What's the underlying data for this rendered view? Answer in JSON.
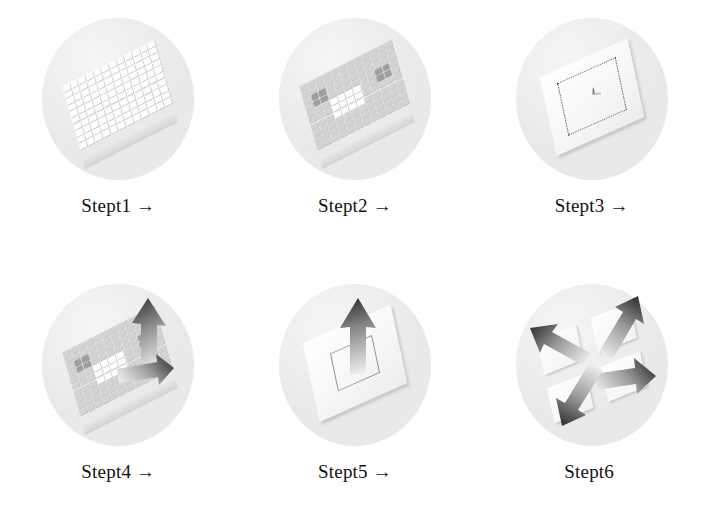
{
  "figure": {
    "columns": 3,
    "rows": 2,
    "background_color": "#ffffff",
    "disc_color": "#e9e9e9",
    "arrow_dark_color": "#3d3d3d",
    "arrow_light_color": "#e6e6e6",
    "block_color": "#fdfdfd",
    "shaded_block_color": "#d3d3d3",
    "label_color": "#111111"
  },
  "steps": [
    {
      "id": "step1",
      "label": "Stept1",
      "arrow": "→",
      "has_arrow": true,
      "scene": "block-array-plain",
      "description": "Uniform white block array in perspective"
    },
    {
      "id": "step2",
      "label": "Stept2",
      "arrow": "→",
      "has_arrow": true,
      "scene": "block-array-shaded",
      "description": "Block array with gray shaded regions"
    },
    {
      "id": "step3",
      "label": "Stept3",
      "arrow": "→",
      "has_arrow": true,
      "scene": "plate-dotted",
      "description": "Flat plate with dotted inner square and small marker"
    },
    {
      "id": "step4",
      "label": "Stept4",
      "arrow": "→",
      "has_arrow": true,
      "scene": "block-array-arrows",
      "description": "Shaded block array with two emerging arrows"
    },
    {
      "id": "step5",
      "label": "Stept5",
      "arrow": "→",
      "has_arrow": true,
      "scene": "plate-arrow-up",
      "description": "Flat plate with single large arrow pointing up"
    },
    {
      "id": "step6",
      "label": "Stept6",
      "arrow": "",
      "has_arrow": false,
      "scene": "tiles-four-arrows",
      "description": "Four tiles with four arrows radiating outward"
    }
  ],
  "array_rows": [
    {
      "cells": [
        "w",
        "w",
        "w",
        "w",
        "w",
        "w",
        "w",
        "w",
        "w",
        "w",
        "w",
        "w"
      ]
    },
    {
      "cells": [
        "w",
        "w",
        "w",
        "w",
        "w",
        "w",
        "w",
        "w",
        "w",
        "w",
        "w",
        "w"
      ]
    },
    {
      "cells": [
        "w",
        "w",
        "w",
        "w",
        "w",
        "w",
        "w",
        "w",
        "w",
        "w",
        "w",
        "w"
      ]
    },
    {
      "cells": [
        "w",
        "w",
        "w",
        "w",
        "w",
        "w",
        "w",
        "w",
        "w",
        "w",
        "w",
        "w"
      ]
    },
    {
      "cells": [
        "w",
        "w",
        "w",
        "w",
        "w",
        "w",
        "w",
        "w",
        "w",
        "w",
        "w",
        "w"
      ]
    },
    {
      "cells": [
        "w",
        "w",
        "w",
        "w",
        "w",
        "w",
        "w",
        "w",
        "w",
        "w",
        "w",
        "w"
      ]
    },
    {
      "cells": [
        "w",
        "w",
        "w",
        "w",
        "w",
        "w",
        "w",
        "w",
        "w",
        "w",
        "w",
        "w"
      ]
    },
    {
      "cells": [
        "w",
        "w",
        "w",
        "w",
        "w",
        "w",
        "w",
        "w",
        "w",
        "w",
        "w",
        "w"
      ]
    },
    {
      "cells": [
        "w",
        "w",
        "w",
        "w",
        "w",
        "w",
        "w",
        "w",
        "w",
        "w",
        "w",
        "w"
      ]
    },
    {
      "cells": [
        "w",
        "w",
        "w",
        "w",
        "w",
        "w",
        "w",
        "w",
        "w",
        "w",
        "w",
        "w"
      ]
    }
  ],
  "shaded_pattern": [
    {
      "cells": [
        "g",
        "g",
        "g",
        "g",
        "g",
        "g",
        "g",
        "g",
        "g",
        "g",
        "g",
        "g"
      ]
    },
    {
      "cells": [
        "g",
        "g",
        "g",
        "g",
        "g",
        "g",
        "g",
        "g",
        "g",
        "g",
        "g",
        "g"
      ]
    },
    {
      "cells": [
        "g",
        "d",
        "d",
        "g",
        "g",
        "g",
        "g",
        "g",
        "g",
        "g",
        "g",
        "g"
      ]
    },
    {
      "cells": [
        "g",
        "d",
        "d",
        "g",
        "g",
        "g",
        "g",
        "g",
        "g",
        "d",
        "d",
        "g"
      ]
    },
    {
      "cells": [
        "g",
        "g",
        "g",
        "w",
        "w",
        "w",
        "w",
        "g",
        "g",
        "d",
        "d",
        "g"
      ]
    },
    {
      "cells": [
        "g",
        "g",
        "g",
        "w",
        "w",
        "w",
        "w",
        "g",
        "g",
        "g",
        "g",
        "g"
      ]
    },
    {
      "cells": [
        "g",
        "g",
        "g",
        "w",
        "w",
        "w",
        "w",
        "g",
        "g",
        "g",
        "g",
        "g"
      ]
    },
    {
      "cells": [
        "g",
        "g",
        "g",
        "g",
        "g",
        "g",
        "g",
        "g",
        "g",
        "g",
        "g",
        "g"
      ]
    },
    {
      "cells": [
        "g",
        "g",
        "g",
        "g",
        "g",
        "g",
        "g",
        "g",
        "g",
        "g",
        "g",
        "g"
      ]
    },
    {
      "cells": [
        "g",
        "g",
        "g",
        "g",
        "g",
        "g",
        "g",
        "g",
        "g",
        "g",
        "g",
        "g"
      ]
    }
  ]
}
